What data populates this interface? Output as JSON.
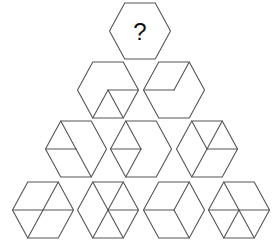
{
  "puzzle": {
    "question_label": "?",
    "rows": [
      {
        "row": 1,
        "hexagons": [
          {
            "id": "q",
            "lines": []
          }
        ]
      },
      {
        "row": 2,
        "hexagons": [
          {
            "id": "r2h1",
            "lines": [
              [
                "O",
                "R"
              ],
              [
                "O",
                "BL"
              ],
              [
                "O",
                "BR"
              ]
            ]
          },
          {
            "id": "r2h2",
            "lines": [
              [
                "L",
                "O"
              ],
              [
                "O",
                "TR"
              ]
            ]
          }
        ]
      },
      {
        "row": 3,
        "hexagons": [
          {
            "id": "r3h1",
            "lines": [
              [
                "TL",
                "O"
              ],
              [
                "O",
                "BR"
              ],
              [
                "L",
                "O"
              ]
            ]
          },
          {
            "id": "r3h2",
            "lines": [
              [
                "L",
                "O"
              ],
              [
                "O",
                "TL"
              ],
              [
                "O",
                "BL"
              ]
            ]
          },
          {
            "id": "r3h3",
            "lines": [
              [
                "TL",
                "O"
              ],
              [
                "TR",
                "O"
              ],
              [
                "O",
                "R"
              ],
              [
                "O",
                "BL"
              ]
            ]
          }
        ]
      },
      {
        "row": 4,
        "hexagons": [
          {
            "id": "r4h1",
            "lines": [
              [
                "L",
                "R"
              ],
              [
                "TR",
                "O"
              ],
              [
                "O",
                "BL"
              ]
            ]
          },
          {
            "id": "r4h2",
            "lines": [
              [
                "TL",
                "O"
              ],
              [
                "TR",
                "O"
              ],
              [
                "O",
                "R"
              ],
              [
                "O",
                "BL"
              ],
              [
                "O",
                "BR"
              ]
            ]
          },
          {
            "id": "r4h3",
            "lines": [
              [
                "L",
                "O"
              ],
              [
                "O",
                "TR"
              ],
              [
                "O",
                "BR"
              ]
            ]
          },
          {
            "id": "r4h4",
            "lines": [
              [
                "L",
                "R"
              ],
              [
                "TL",
                "O"
              ],
              [
                "O",
                "BL"
              ],
              [
                "O",
                "BR"
              ]
            ]
          }
        ]
      }
    ]
  }
}
